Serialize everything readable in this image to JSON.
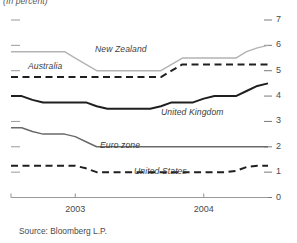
{
  "chart_data": {
    "type": "line",
    "title": "(In percent)",
    "xlabel": "",
    "ylabel": "",
    "ylim": [
      0,
      7
    ],
    "yticks": [
      0,
      1,
      2,
      3,
      4,
      5,
      6,
      7
    ],
    "ytick_labels": [
      "0",
      "1",
      "2",
      "3",
      "4",
      "5",
      "6",
      "7"
    ],
    "xlim": [
      0,
      24
    ],
    "xticks": [
      6,
      18
    ],
    "xtick_labels": [
      "2003",
      "2004"
    ],
    "grid": false,
    "legend": "inline-labels",
    "source": "Source: Bloomberg L.P.",
    "x": [
      0,
      1,
      2,
      3,
      4,
      5,
      6,
      7,
      8,
      9,
      10,
      11,
      12,
      13,
      14,
      15,
      16,
      17,
      18,
      19,
      20,
      21,
      22,
      23,
      24
    ],
    "series": [
      {
        "name": "New Zealand",
        "color": "#b3b3b3",
        "style": "solid",
        "width": 1.4,
        "label_x": 95,
        "label_y": 44,
        "values": [
          5.75,
          5.75,
          5.75,
          5.75,
          5.75,
          5.75,
          5.5,
          5.25,
          5.0,
          5.0,
          5.0,
          5.0,
          5.0,
          5.0,
          5.0,
          5.25,
          5.5,
          5.5,
          5.5,
          5.5,
          5.5,
          5.5,
          5.75,
          5.9,
          6.0
        ]
      },
      {
        "name": "Australia",
        "color": "#1f1f1f",
        "style": "dashed",
        "width": 2.0,
        "label_x": 28,
        "label_y": 61,
        "values": [
          4.75,
          4.75,
          4.75,
          4.75,
          4.75,
          4.75,
          4.75,
          4.75,
          4.75,
          4.75,
          4.75,
          4.75,
          4.75,
          4.75,
          4.75,
          5.0,
          5.25,
          5.25,
          5.25,
          5.25,
          5.25,
          5.25,
          5.25,
          5.25,
          5.25
        ]
      },
      {
        "name": "United Kingdom",
        "color": "#1f1f1f",
        "style": "solid",
        "width": 2.0,
        "label_x": 161,
        "label_y": 107,
        "values": [
          4.0,
          4.0,
          3.85,
          3.75,
          3.75,
          3.75,
          3.75,
          3.75,
          3.6,
          3.5,
          3.5,
          3.5,
          3.5,
          3.5,
          3.6,
          3.75,
          3.75,
          3.75,
          3.9,
          4.0,
          4.0,
          4.0,
          4.2,
          4.4,
          4.5
        ]
      },
      {
        "name": "Euro zone",
        "color": "#6a6a6a",
        "style": "solid",
        "width": 1.5,
        "label_x": 100,
        "label_y": 140,
        "values": [
          2.75,
          2.75,
          2.6,
          2.5,
          2.5,
          2.5,
          2.4,
          2.2,
          2.0,
          2.0,
          2.0,
          2.0,
          2.0,
          2.0,
          2.0,
          2.0,
          2.0,
          2.0,
          2.0,
          2.0,
          2.0,
          2.0,
          2.0,
          2.0,
          2.0
        ]
      },
      {
        "name": "United States",
        "color": "#1f1f1f",
        "style": "dashed",
        "width": 2.0,
        "label_x": 134,
        "label_y": 166,
        "values": [
          1.25,
          1.25,
          1.25,
          1.25,
          1.25,
          1.25,
          1.25,
          1.15,
          1.0,
          1.0,
          1.0,
          1.0,
          1.0,
          1.0,
          1.0,
          1.0,
          1.0,
          1.0,
          1.0,
          1.0,
          1.0,
          1.05,
          1.2,
          1.25,
          1.25
        ]
      }
    ]
  }
}
